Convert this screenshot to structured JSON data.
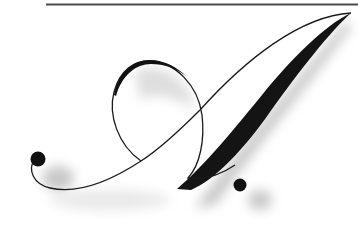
{
  "artwork": {
    "subject": "Calligraphic letter A",
    "letter": "A",
    "colors": {
      "background": "#ffffff",
      "ink": "#1a1a1a",
      "rule": "#4a4a4a",
      "shadow": "#8a8a8a"
    }
  }
}
